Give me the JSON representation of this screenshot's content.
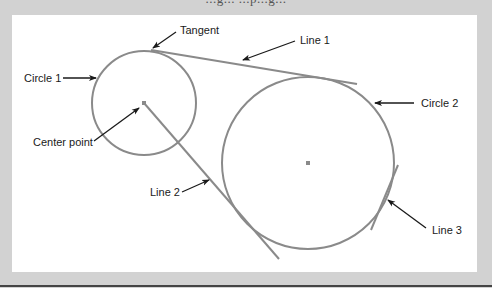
{
  "figure": {
    "caption_partial": "...g... ...p...g...",
    "background_color": "#d2d2d2",
    "panel_color": "#ffffff",
    "geometry_color": "#8a8a8a",
    "annotation_color": "#1a1a1a"
  },
  "labels": {
    "tangent": "Tangent",
    "line1": "Line 1",
    "circle1": "Circle 1",
    "circle2": "Circle 2",
    "center_point": "Center point",
    "line2": "Line 2",
    "line3": "Line 3"
  },
  "shapes": {
    "circle1": {
      "cx": 144,
      "cy": 103,
      "r": 52
    },
    "circle2": {
      "cx": 308,
      "cy": 163,
      "r": 86
    },
    "center1": {
      "x": 144,
      "y": 103
    },
    "center2": {
      "x": 308,
      "y": 163
    },
    "line1": {
      "x1": 151,
      "y1": 50,
      "x2": 357,
      "y2": 84
    },
    "line2": {
      "x1": 144,
      "y1": 103,
      "x2": 279,
      "y2": 259
    },
    "line3": {
      "x1": 398,
      "y1": 165,
      "x2": 371,
      "y2": 230
    }
  }
}
